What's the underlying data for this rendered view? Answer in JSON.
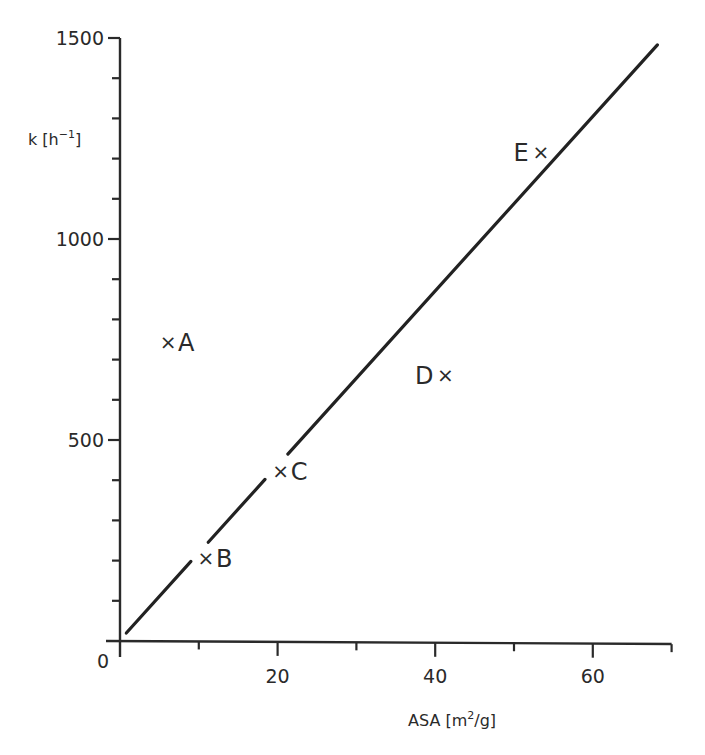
{
  "chart_data": {
    "type": "scatter",
    "title": "",
    "xlabel": "ASA [m2/g]",
    "ylabel": "k [h-1]",
    "xlabel_parts": {
      "main": "ASA [m",
      "sup": "2",
      "rest": "/g]"
    },
    "ylabel_parts": {
      "main": "k [h",
      "sup": "−1",
      "rest": "]"
    },
    "xlim": [
      0,
      70
    ],
    "ylim": [
      0,
      1500
    ],
    "x_ticks_major": [
      0,
      20,
      40,
      60
    ],
    "x_ticks_minor": [
      10,
      30,
      50,
      70
    ],
    "x_tick_labels": [
      "0",
      "20",
      "40",
      "60"
    ],
    "y_ticks_major": [
      0,
      500,
      1000,
      1500
    ],
    "y_ticks_minor": [
      100,
      200,
      300,
      400,
      600,
      700,
      800,
      900,
      1100,
      1200,
      1300,
      1400
    ],
    "y_tick_labels": [
      "500",
      "1000",
      "1500"
    ],
    "origin_label": "0",
    "grid": false,
    "legend": null,
    "marker": "×",
    "points": [
      {
        "label": "A",
        "x": 6.1,
        "y": 744
      },
      {
        "label": "B",
        "x": 10.9,
        "y": 206
      },
      {
        "label": "C",
        "x": 20.4,
        "y": 423
      },
      {
        "label": "D",
        "x": 41.3,
        "y": 662
      },
      {
        "label": "E",
        "x": 53.4,
        "y": 1216
      }
    ],
    "fit_line": {
      "x": [
        0.8,
        68.2
      ],
      "y": [
        20,
        1483
      ],
      "style": "solid, broken near B and C markers"
    }
  },
  "caption": {
    "text": "",
    "note": "caption line cut off at bottom edge, illegible"
  }
}
